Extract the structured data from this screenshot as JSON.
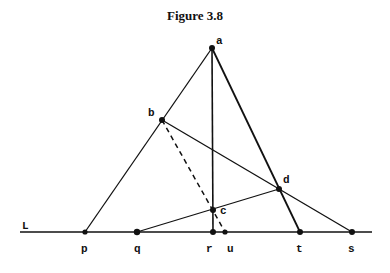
{
  "figure": {
    "title": "Figure 3.8",
    "line_label": "L",
    "points": {
      "a": {
        "label": "a",
        "x": 212,
        "y": 48
      },
      "b": {
        "label": "b",
        "x": 162,
        "y": 120
      },
      "c": {
        "label": "c",
        "x": 213,
        "y": 210
      },
      "d": {
        "label": "d",
        "x": 279,
        "y": 189
      },
      "p": {
        "label": "p",
        "x": 85,
        "y": 232
      },
      "q": {
        "label": "q",
        "x": 137,
        "y": 232
      },
      "r": {
        "label": "r",
        "x": 213,
        "y": 232
      },
      "u": {
        "label": "u",
        "x": 225,
        "y": 232
      },
      "t": {
        "label": "t",
        "x": 300,
        "y": 232
      },
      "s": {
        "label": "s",
        "x": 352,
        "y": 232
      }
    },
    "segments": [
      [
        "a",
        "p"
      ],
      [
        "a",
        "t"
      ],
      [
        "a",
        "r"
      ],
      [
        "b",
        "s"
      ],
      [
        "q",
        "d"
      ]
    ],
    "dashed_segments": [
      [
        "b",
        "u"
      ]
    ],
    "stroke_color": "#111111"
  }
}
